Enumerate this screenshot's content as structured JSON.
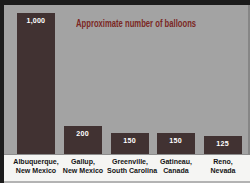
{
  "chart_data": {
    "type": "bar",
    "title": "Approximate number of balloons",
    "categories": [
      "Albuquerque, New Mexico",
      "Gallup, New Mexico",
      "Greenville, South Carolina",
      "Gatineau, Canada",
      "Reno, Nevada"
    ],
    "category_lines": [
      [
        "Albuquerque,",
        "New Mexico"
      ],
      [
        "Gallup,",
        "New Mexico"
      ],
      [
        "Greenville,",
        "South Carolina"
      ],
      [
        "Gatineau,",
        "Canada"
      ],
      [
        "Reno,",
        "Nevada"
      ]
    ],
    "values": [
      1000,
      200,
      150,
      150,
      125
    ],
    "value_labels": [
      "1,000",
      "200",
      "150",
      "150",
      "125"
    ],
    "xlabel": "",
    "ylabel": "",
    "ylim": [
      0,
      1000
    ],
    "grid": false,
    "legend": false
  },
  "colors": {
    "plot_bg": "#a3a3a3",
    "frame_color": "#1c1c1c",
    "bar_color": "#413232",
    "title_color": "#7b2723",
    "value_label_color": "#ffffff",
    "axis_label_color": "#141414",
    "strip_bg": "#f5f5f3"
  }
}
